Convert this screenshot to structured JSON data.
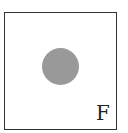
{
  "figure": {
    "label": "F",
    "circle_color": "#999999",
    "border_color": "#333333"
  }
}
